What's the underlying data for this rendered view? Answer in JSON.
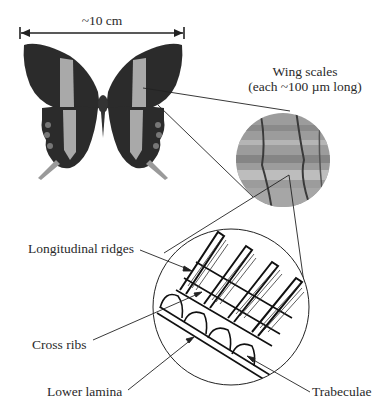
{
  "scale_bar": {
    "label": "~10 cm"
  },
  "wing_scales": {
    "line1": "Wing scales",
    "line2": "(each ~100 µm long)"
  },
  "labels": {
    "longitudinal_ridges": "Longitudinal ridges",
    "cross_ribs": "Cross ribs",
    "lower_lamina": "Lower lamina",
    "trabeculae": "Trabeculae"
  },
  "colors": {
    "wing_dark": "#2b2b2b",
    "wing_band": "#a9a9a9",
    "micrograph": "#9a9a9a",
    "line": "#222222"
  }
}
